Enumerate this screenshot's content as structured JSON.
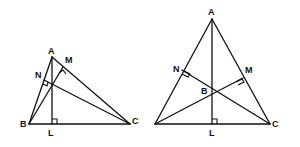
{
  "figures": [
    {
      "id": "obtuse-left",
      "labels": {
        "A": "A",
        "B": "B",
        "C": "C",
        "L": "L",
        "M": "M",
        "N": "N"
      }
    },
    {
      "id": "acute-right",
      "labels": {
        "A": "A",
        "B": "B",
        "C": "C",
        "L": "L",
        "M": "M",
        "N": "N"
      }
    }
  ],
  "colors": {
    "stroke": "#111111",
    "background": "#ffffff"
  }
}
